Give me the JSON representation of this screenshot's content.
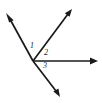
{
  "figure": {
    "background_color": "#ffffff",
    "stroke_color": "#1a1a1a",
    "width": 102,
    "height": 103,
    "vertex": {
      "x": 33,
      "y": 61
    },
    "rays": [
      {
        "name": "ray-upper-left",
        "from": {
          "x": 33,
          "y": 61
        },
        "to": {
          "x": 6,
          "y": 13
        },
        "arrow": true
      },
      {
        "name": "ray-upper-right",
        "from": {
          "x": 33,
          "y": 61
        },
        "to": {
          "x": 72,
          "y": 9
        },
        "arrow": true
      },
      {
        "name": "ray-right-horizontal",
        "from": {
          "x": 33,
          "y": 61
        },
        "to": {
          "x": 98,
          "y": 61
        },
        "arrow": true
      },
      {
        "name": "ray-lower-right",
        "from": {
          "x": 33,
          "y": 61
        },
        "to": {
          "x": 60,
          "y": 97
        },
        "arrow": true
      }
    ],
    "labels": [
      {
        "name": "angle-label-1",
        "text": "1",
        "x": 30,
        "y": 42
      },
      {
        "name": "angle-label-2",
        "text": "2",
        "x": 44,
        "y": 49
      },
      {
        "name": "angle-label-3",
        "text": "3",
        "x": 43,
        "y": 62
      }
    ]
  }
}
